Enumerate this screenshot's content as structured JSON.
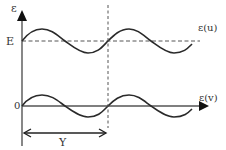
{
  "diagram": {
    "colors": {
      "stroke": "#333333",
      "dashed": "#555555",
      "background": "#ffffff"
    },
    "labels": {
      "y_axis": "ε",
      "level_E": "E",
      "curve_top": "ε(u)",
      "origin": "0",
      "curve_bottom": "ε(v)",
      "period": "Y"
    },
    "elements": [
      {
        "id": "vertical-axis",
        "type": "arrow",
        "from": [
          22,
          145
        ],
        "to": [
          22,
          14
        ]
      },
      {
        "id": "level-E-line",
        "type": "dashed-line",
        "y": 41,
        "from_x": 22,
        "to_x": 200
      },
      {
        "id": "curve-u",
        "type": "sine-wave",
        "baseline_y": 41,
        "amplitude": 12,
        "start_x": 22,
        "end_x": 192,
        "period_px": 86
      },
      {
        "id": "horizontal-axis-v",
        "type": "arrow",
        "y": 106,
        "from_x": 22,
        "to_x": 205
      },
      {
        "id": "curve-v",
        "type": "sine-wave",
        "baseline_y": 106,
        "amplitude": 11,
        "start_x": 22,
        "end_x": 192,
        "period_px": 86
      },
      {
        "id": "period-marker",
        "type": "dashed-line",
        "x": 108,
        "from_y": 5,
        "to_y": 128
      },
      {
        "id": "period-arrow",
        "type": "double-arrow",
        "y": 133,
        "from_x": 22,
        "to_x": 108
      }
    ]
  }
}
